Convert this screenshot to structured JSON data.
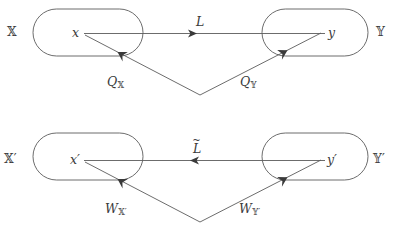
{
  "figure": {
    "stroke_color": "#5b5b5b",
    "text_color": "#3a3a3a",
    "background": "#ffffff"
  },
  "top_row": {
    "left_set_label": "𝕏",
    "right_set_label": "𝕐",
    "left_node_label": "x",
    "right_node_label": "y",
    "horizontal_map_label": "L",
    "horizontal_map_direction": "right",
    "left_down_map_label": "Q",
    "left_down_map_subscript": "𝕏",
    "right_down_map_label": "Q",
    "right_down_map_subscript": "𝕐"
  },
  "bottom_row": {
    "left_set_label": "𝕏′",
    "right_set_label": "𝕐′",
    "left_node_label": "x′",
    "right_node_label": "y′",
    "horizontal_map_label": "L",
    "horizontal_map_accent": "~",
    "horizontal_map_direction": "left",
    "left_down_map_label": "W",
    "left_down_map_subscript": "𝕏′",
    "right_down_map_label": "W",
    "right_down_map_subscript": "𝕐′"
  }
}
